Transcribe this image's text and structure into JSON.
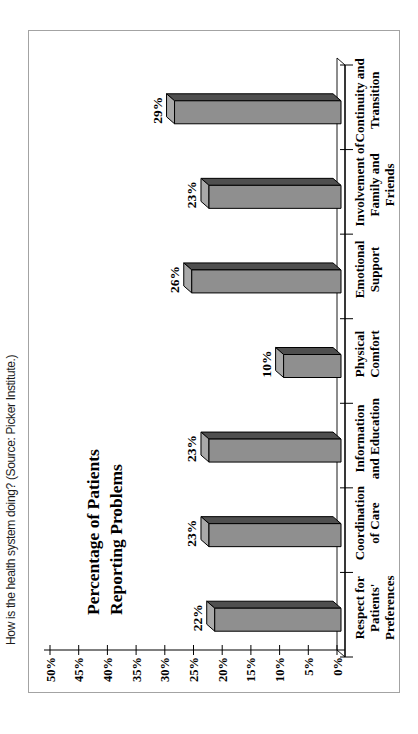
{
  "caption": {
    "text": "How is the health system doing? (Source: Picker Institute.)"
  },
  "chart_data": {
    "type": "bar",
    "style": "3d-column",
    "rotation": "chart is landscape, rotated 90 degrees counterclockwise on the portrait page",
    "title": "Percentage of Patients Reporting Problems",
    "title_lines": [
      "Percentage of Patients",
      "Reporting Problems"
    ],
    "categories": [
      "Respect for Patients' Preferences",
      "Coordination of Care",
      "Information and Education",
      "Physical Comfort",
      "Emotional Support",
      "Involvement of Family and Friends",
      "Continuity and Transition"
    ],
    "category_lines": [
      [
        "Respect for",
        "Patients'",
        "Preferences"
      ],
      [
        "Coordination",
        "of Care"
      ],
      [
        "Information",
        "and Education"
      ],
      [
        "Physical",
        "Comfort"
      ],
      [
        "Emotional",
        "Support"
      ],
      [
        "Involvement of",
        "Family and",
        "Friends"
      ],
      [
        "Continuity and",
        "Transition"
      ]
    ],
    "values": [
      22,
      23,
      23,
      10,
      26,
      23,
      29
    ],
    "value_labels": [
      "22%",
      "23%",
      "23%",
      "10%",
      "26%",
      "23%",
      "29%"
    ],
    "ylim": [
      0,
      50
    ],
    "ytick_step": 5,
    "ytick_labels": [
      "0%",
      "5%",
      "10%",
      "15%",
      "20%",
      "25%",
      "30%",
      "35%",
      "40%",
      "45%",
      "50%"
    ],
    "grid": "off",
    "legend": "none",
    "colors": {
      "bar_front": "#8f8f8f",
      "bar_top": "#a9a9a9",
      "bar_side": "#4f4f4f",
      "outline": "#000000",
      "floor": "#ffffff",
      "frame_border": "#a3a3a3",
      "text": "#000000"
    }
  }
}
